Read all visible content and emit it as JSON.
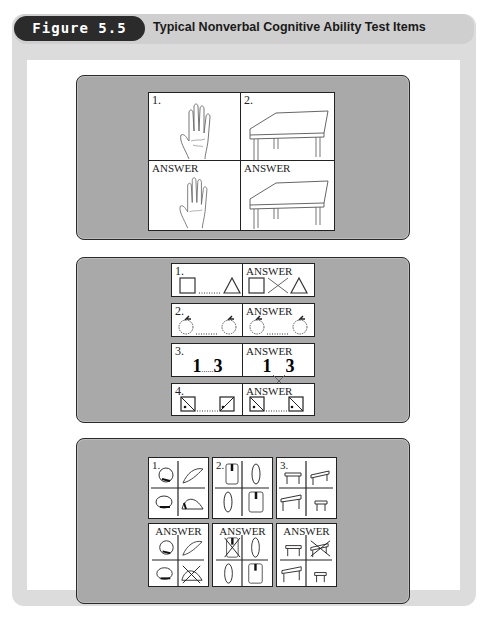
{
  "header": {
    "figure_label": "Figure 5.5",
    "title": "Typical Nonverbal Cognitive Ability Test Items"
  },
  "panel_picture_completion": {
    "items": [
      {
        "label": "1.",
        "subject": "hand",
        "answer_label": "ANSWER"
      },
      {
        "label": "2.",
        "subject": "table",
        "answer_label": "ANSWER"
      }
    ]
  },
  "panel_sequence": {
    "rows": [
      {
        "label": "1.",
        "answer_label": "ANSWER",
        "subject": "square-to-triangle",
        "dots": "......"
      },
      {
        "label": "2.",
        "answer_label": "ANSWER",
        "subject": "apples",
        "dots": "......"
      },
      {
        "label": "3.",
        "answer_label": "ANSWER",
        "left": "1",
        "right": "3",
        "dots": "......"
      },
      {
        "label": "4.",
        "answer_label": "ANSWER",
        "subject": "diagonal-squares",
        "dots": "......"
      }
    ]
  },
  "panel_odd_one_out": {
    "items": [
      {
        "label": "1.",
        "subject": "hats",
        "answer_label": "ANSWER",
        "crossed_quadrant": "bottom-right"
      },
      {
        "label": "2.",
        "subject": "jackets",
        "answer_label": "ANSWER",
        "crossed_quadrant": "top-left"
      },
      {
        "label": "3.",
        "subject": "tables",
        "answer_label": "ANSWER",
        "crossed_quadrant": "top-right"
      }
    ]
  },
  "colors": {
    "panel_gray": "#a9a9a9",
    "frame_gray": "#dcdcdc",
    "label_dark": "#2b2b2b"
  }
}
